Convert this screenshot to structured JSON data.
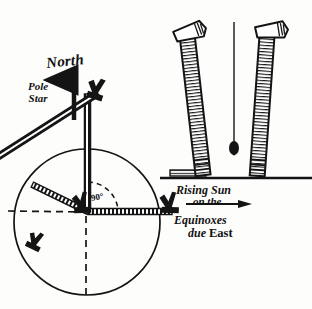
{
  "figure": {
    "kind": "astronomical-survey-diagram",
    "medium": "ink-line-drawing",
    "background_color": "#fdfdfc",
    "ink_color": "#141414"
  },
  "labels": {
    "north": "North",
    "pole_star_line1": "Pole",
    "pole_star_line2": "Star",
    "right_angle": "90°",
    "rising_sun_line1": "Rising Sun",
    "rising_sun_line2": "on the",
    "equinoxes_line1": "Equinoxes",
    "equinoxes_line2_prefix": "due ",
    "equinoxes_line2_east": "East"
  },
  "icons": {
    "north_arrow": "up-arrow-icon",
    "east_arrow": "right-arrow-icon",
    "plumb_bob": "plumb-bob-icon",
    "sight_vane_top": "sighting-vane-icon",
    "sight_vane_center": "sighting-vane-icon",
    "sight_vane_southwest": "sighting-vane-icon",
    "sight_vane_east": "sighting-vane-icon",
    "ground_marker": "ground-marker-icon"
  },
  "geometry": {
    "circle": {
      "cx": 87,
      "cy": 222,
      "r": 73
    },
    "triangle": {
      "apex_top": [
        95,
        92
      ],
      "vertex_center": [
        88,
        213
      ],
      "vertex_east": [
        170,
        212
      ]
    },
    "dashed_west_end": [
      8,
      211
    ],
    "dashed_south_end": [
      86,
      296
    ],
    "ground_line_y": 178,
    "ground_line_x1": 160,
    "ground_line_x2": 312,
    "post_left": {
      "top": [
        200,
        22
      ],
      "base": [
        182,
        176
      ],
      "tilt_deg": -7
    },
    "post_right": {
      "top": [
        266,
        20
      ],
      "base": [
        255,
        176
      ],
      "tilt_deg": 4
    },
    "plumb_line_x": 234,
    "plumb_line_top": 22,
    "plumb_bob_y": 146
  }
}
